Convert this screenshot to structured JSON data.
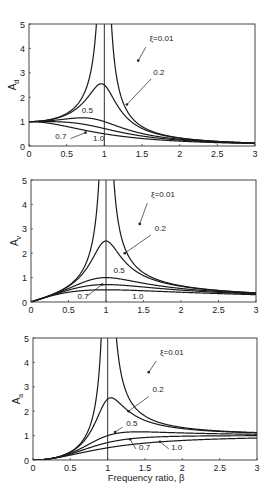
{
  "chart_data": [
    {
      "type": "line",
      "title": "",
      "xlabel": "",
      "ylabel": "A_d",
      "ylabel_main": "A",
      "ylabel_sub": "d",
      "xlim": [
        0,
        3
      ],
      "ylim": [
        0,
        5
      ],
      "xticks": [
        "0",
        "0.5",
        "1",
        "1.5",
        "2",
        "2.5",
        "3"
      ],
      "yticks": [
        "0",
        "1",
        "2",
        "3",
        "4",
        "5"
      ],
      "grid": false,
      "vertical_line_x": 1,
      "formula": "1/sqrt((1-b^2)^2+(2*xi*b)^2)",
      "power": 0,
      "series": [
        {
          "name": "ξ=0.01",
          "xi": 0.01,
          "x": [
            0,
            0.5,
            0.8,
            0.9,
            1.0,
            1.2,
            1.5,
            2.0,
            3.0
          ],
          "values": [
            1.0,
            1.33,
            2.78,
            5.26,
            50.0,
            2.27,
            0.8,
            0.33,
            0.125
          ]
        },
        {
          "name": "0.2",
          "xi": 0.2,
          "x": [
            0,
            0.5,
            0.8,
            0.95,
            1.0,
            1.2,
            1.5,
            2.0,
            3.0
          ],
          "values": [
            1.0,
            1.28,
            2.02,
            2.55,
            2.5,
            1.56,
            0.74,
            0.32,
            0.12
          ]
        },
        {
          "name": "0.5",
          "xi": 0.5,
          "x": [
            0,
            0.5,
            0.7,
            1.0,
            1.5,
            2.0,
            3.0
          ],
          "values": [
            1.0,
            1.11,
            1.15,
            1.0,
            0.55,
            0.28,
            0.12
          ]
        },
        {
          "name": "0.7",
          "xi": 0.7,
          "x": [
            0,
            0.5,
            1.0,
            1.5,
            2.0,
            3.0
          ],
          "values": [
            1.0,
            0.94,
            0.71,
            0.42,
            0.24,
            0.11
          ]
        },
        {
          "name": "1.0",
          "xi": 1.0,
          "x": [
            0,
            0.5,
            1.0,
            1.5,
            2.0,
            3.0
          ],
          "values": [
            1.0,
            0.8,
            0.5,
            0.31,
            0.2,
            0.1
          ]
        }
      ],
      "annotations": [
        {
          "text": "ξ=0.01",
          "x": 1.6,
          "y": 4.3
        },
        {
          "text": "0.2",
          "x": 1.65,
          "y": 2.9
        },
        {
          "text": "0.5",
          "x": 0.7,
          "y": 1.35
        },
        {
          "text": "0.7",
          "x": 0.35,
          "y": 0.3
        },
        {
          "text": "1.0",
          "x": 0.85,
          "y": 0.2
        }
      ]
    },
    {
      "type": "line",
      "title": "",
      "xlabel": "",
      "ylabel": "A_v",
      "ylabel_main": "A",
      "ylabel_sub": "v",
      "xlim": [
        0,
        3
      ],
      "ylim": [
        0,
        5
      ],
      "xticks": [
        "0",
        "0.5",
        "1",
        "1.5",
        "2",
        "2.5",
        "3"
      ],
      "yticks": [
        "0",
        "1",
        "2",
        "3",
        "4",
        "5"
      ],
      "grid": false,
      "vertical_line_x": 1,
      "formula": "b/sqrt((1-b^2)^2+(2*xi*b)^2)",
      "power": 1,
      "series": [
        {
          "name": "ξ=0.01",
          "xi": 0.01,
          "x": [
            0,
            0.5,
            0.8,
            0.9,
            1.0,
            1.2,
            1.5,
            2.0,
            3.0
          ],
          "values": [
            0,
            0.67,
            2.22,
            4.73,
            50.0,
            2.73,
            1.2,
            0.67,
            0.375
          ]
        },
        {
          "name": "0.2",
          "xi": 0.2,
          "x": [
            0,
            0.5,
            0.8,
            1.0,
            1.2,
            1.5,
            2.0,
            3.0
          ],
          "values": [
            0,
            0.64,
            1.62,
            2.5,
            1.87,
            1.11,
            0.64,
            0.37
          ]
        },
        {
          "name": "0.5",
          "xi": 0.5,
          "x": [
            0,
            0.5,
            1.0,
            1.5,
            2.0,
            3.0
          ],
          "values": [
            0,
            0.55,
            1.0,
            0.83,
            0.55,
            0.35
          ]
        },
        {
          "name": "0.7",
          "xi": 0.7,
          "x": [
            0,
            0.5,
            1.0,
            1.5,
            2.0,
            3.0
          ],
          "values": [
            0,
            0.47,
            0.71,
            0.63,
            0.48,
            0.33
          ]
        },
        {
          "name": "1.0",
          "xi": 1.0,
          "x": [
            0,
            0.5,
            1.0,
            1.5,
            2.0,
            3.0
          ],
          "values": [
            0,
            0.4,
            0.5,
            0.46,
            0.4,
            0.3
          ]
        }
      ],
      "annotations": [
        {
          "text": "ξ=0.01",
          "x": 1.6,
          "y": 4.3
        },
        {
          "text": "0.2",
          "x": 1.65,
          "y": 2.9
        },
        {
          "text": "0.5",
          "x": 1.1,
          "y": 1.2
        },
        {
          "text": "0.7",
          "x": 0.62,
          "y": 0.12
        },
        {
          "text": "1.0",
          "x": 1.35,
          "y": 0.12
        }
      ]
    },
    {
      "type": "line",
      "title": "",
      "xlabel": "Frequency ratio, β",
      "ylabel": "A_a",
      "ylabel_main": "A",
      "ylabel_sub": "a",
      "xlim": [
        0,
        3
      ],
      "ylim": [
        0,
        5
      ],
      "xticks": [
        "0",
        "0.5",
        "1",
        "1.5",
        "2",
        "2.5",
        "3"
      ],
      "yticks": [
        "0",
        "1",
        "2",
        "3",
        "4",
        "5"
      ],
      "grid": false,
      "vertical_line_x": 1,
      "formula": "b^2/sqrt((1-b^2)^2+(2*xi*b)^2)",
      "power": 2,
      "series": [
        {
          "name": "ξ=0.01",
          "xi": 0.01,
          "x": [
            0,
            0.5,
            0.8,
            0.9,
            1.0,
            1.2,
            1.5,
            2.0,
            3.0
          ],
          "values": [
            0,
            0.33,
            1.78,
            4.26,
            50.0,
            3.27,
            1.8,
            1.33,
            1.12
          ]
        },
        {
          "name": "0.2",
          "xi": 0.2,
          "x": [
            0,
            0.5,
            0.8,
            1.0,
            1.05,
            1.5,
            2.0,
            3.0
          ],
          "values": [
            0,
            0.32,
            1.3,
            2.5,
            2.55,
            1.67,
            1.29,
            1.1
          ]
        },
        {
          "name": "0.5",
          "xi": 0.5,
          "x": [
            0,
            0.5,
            1.0,
            1.5,
            2.0,
            3.0
          ],
          "values": [
            0,
            0.28,
            1.0,
            1.24,
            1.11,
            1.04
          ]
        },
        {
          "name": "0.7",
          "xi": 0.7,
          "x": [
            0,
            0.5,
            1.0,
            1.5,
            2.0,
            3.0
          ],
          "values": [
            0,
            0.24,
            0.71,
            0.94,
            0.97,
            0.99
          ]
        },
        {
          "name": "1.0",
          "xi": 1.0,
          "x": [
            0,
            0.5,
            1.0,
            1.5,
            2.0,
            3.0
          ],
          "values": [
            0,
            0.2,
            0.5,
            0.69,
            0.8,
            0.9
          ]
        }
      ],
      "annotations": [
        {
          "text": "ξ=0.01",
          "x": 1.7,
          "y": 4.3
        },
        {
          "text": "0.2",
          "x": 1.6,
          "y": 2.8
        },
        {
          "text": "0.5",
          "x": 1.25,
          "y": 1.4
        },
        {
          "text": "0.7",
          "x": 1.42,
          "y": 0.4
        },
        {
          "text": "1.0",
          "x": 1.85,
          "y": 0.4
        }
      ]
    }
  ],
  "panels": [
    {
      "ylabel_main": "A",
      "ylabel_sub": "d"
    },
    {
      "ylabel_main": "A",
      "ylabel_sub": "v"
    },
    {
      "ylabel_main": "A",
      "ylabel_sub": "a"
    }
  ],
  "xlabel": "Frequency ratio, β",
  "colors": {
    "line": "#1a1a1a",
    "axis": "#333333",
    "background": "#ffffff"
  }
}
